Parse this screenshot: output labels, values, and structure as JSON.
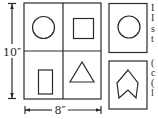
{
  "diagram": {
    "dimensions": {
      "height_label": "10″",
      "width_label": "8″"
    },
    "grid": {
      "cells": [
        {
          "position": "top-left",
          "shape": "circle"
        },
        {
          "position": "top-right",
          "shape": "square"
        },
        {
          "position": "bottom-left",
          "shape": "tall-rectangle"
        },
        {
          "position": "bottom-right",
          "shape": "triangle"
        }
      ]
    },
    "side_panels": [
      {
        "position": "top",
        "shape": "circle"
      },
      {
        "position": "bottom",
        "shape": "chevron-arrow"
      }
    ],
    "edge_text_fragments": {
      "top": [
        "I",
        "I",
        "s",
        "t"
      ],
      "bottom": [
        "(",
        "c",
        "(",
        "l"
      ]
    }
  }
}
